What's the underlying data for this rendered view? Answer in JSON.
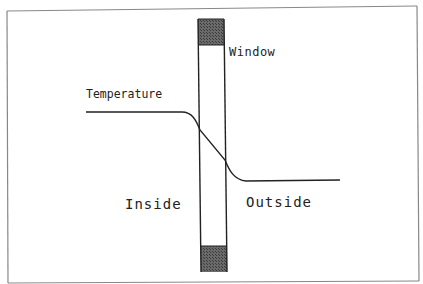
{
  "diagram": {
    "labels": {
      "window": "Window",
      "temperature": "Temperature",
      "inside": "Inside",
      "outside": "Outside"
    },
    "colors": {
      "line": "#222222",
      "frame_fill": "#555555",
      "border": "#777777",
      "background": "#ffffff"
    },
    "elements": [
      {
        "type": "border-frame",
        "description": "outer rectangle border"
      },
      {
        "type": "window-pane",
        "description": "vertical window cross-section with dark frame blocks at top and bottom"
      },
      {
        "type": "temperature-curve",
        "description": "high constant temperature inside, drops across window, low constant outside"
      }
    ]
  }
}
